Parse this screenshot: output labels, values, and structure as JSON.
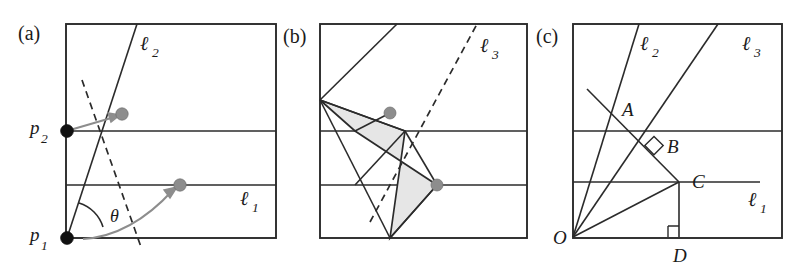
{
  "figure": {
    "width": 807,
    "height": 272,
    "background": "#ffffff",
    "ink_color": "#2b2b2b",
    "accent_grey": "#8d8d8d",
    "shade_fill": "#e6e6e6"
  },
  "panels": [
    {
      "tag": "(a)",
      "tag_pos": {
        "x": 18,
        "y": 40
      },
      "frame": {
        "x": 66,
        "y": 24,
        "w": 210,
        "h": 214
      },
      "horizontal_lines_y": [
        131,
        185
      ],
      "labels": [
        {
          "name": "line-label-l2",
          "base": "ℓ",
          "sub": "2",
          "x": 140,
          "y": 50
        },
        {
          "name": "line-label-l1",
          "base": "ℓ",
          "sub": "1",
          "x": 240,
          "y": 205
        },
        {
          "name": "point-label-p2",
          "base": "p",
          "sub": "2",
          "x": 30,
          "y": 134
        },
        {
          "name": "point-label-p1",
          "base": "p",
          "sub": "1",
          "x": 30,
          "y": 241
        },
        {
          "name": "angle-label-theta",
          "base": "θ",
          "sub": "",
          "x": 110,
          "y": 222
        }
      ],
      "points": [
        {
          "name": "point-p1",
          "x": 67,
          "y": 238,
          "kind": "black"
        },
        {
          "name": "point-p2",
          "x": 67,
          "y": 131,
          "kind": "black"
        },
        {
          "name": "point-moving-upper",
          "x": 122,
          "y": 114,
          "kind": "grey"
        },
        {
          "name": "point-moving-lower",
          "x": 180,
          "y": 185,
          "kind": "grey"
        }
      ],
      "solid_ray": {
        "x1": 67,
        "y1": 238,
        "x2": 137,
        "y2": 24
      },
      "dashed_ray": {
        "x1": 82,
        "y1": 80,
        "x2": 141,
        "y2": 247
      },
      "arrows": [
        {
          "name": "arrow-to-upper-point",
          "from_x": 67,
          "from_y": 131,
          "to_x": 121,
          "to_y": 115
        },
        {
          "name": "arrow-to-lower-point",
          "from_x": 100,
          "from_y": 238,
          "to_x": 179,
          "to_y": 186
        }
      ]
    },
    {
      "tag": "(b)",
      "tag_pos": {
        "x": 283,
        "y": 43
      },
      "frame": {
        "x": 320,
        "y": 24,
        "w": 207,
        "h": 214
      },
      "horizontal_lines_y": [
        131,
        185
      ],
      "labels": [
        {
          "name": "line-label-l3",
          "base": "ℓ",
          "sub": "3",
          "x": 480,
          "y": 52
        }
      ],
      "points": [
        {
          "name": "point-contact-upper",
          "x": 390,
          "y": 113,
          "kind": "grey"
        },
        {
          "name": "point-contact-lower",
          "x": 437,
          "y": 185,
          "kind": "grey"
        }
      ],
      "apex": {
        "x": 320,
        "y": 100
      },
      "dashed_ray": {
        "x1": 370,
        "y1": 222,
        "x2": 477,
        "y2": 24
      },
      "wedge_edges": [
        {
          "x1": 320,
          "y1": 100,
          "x2": 405,
          "y2": 131
        },
        {
          "x1": 320,
          "y1": 100,
          "x2": 397,
          "y2": 24
        },
        {
          "x1": 320,
          "y1": 100,
          "x2": 390,
          "y2": 238
        }
      ],
      "shaded_polygon": [
        [
          320,
          100
        ],
        [
          405,
          131
        ],
        [
          390,
          238
        ],
        [
          437,
          185
        ],
        [
          355,
          131
        ]
      ]
    },
    {
      "tag": "(c)",
      "tag_pos": {
        "x": 536,
        "y": 43
      },
      "frame": {
        "x": 573,
        "y": 24,
        "w": 209,
        "h": 214
      },
      "horizontal_lines_y": [
        131,
        182
      ],
      "labels": [
        {
          "name": "line-label-l2",
          "base": "ℓ",
          "sub": "2",
          "x": 640,
          "y": 50
        },
        {
          "name": "line-label-l3",
          "base": "ℓ",
          "sub": "3",
          "x": 742,
          "y": 50
        },
        {
          "name": "line-label-l1",
          "base": "ℓ",
          "sub": "1",
          "x": 748,
          "y": 206
        },
        {
          "name": "point-label-A",
          "base": "A",
          "sub": "",
          "x": 622,
          "y": 116
        },
        {
          "name": "point-label-B",
          "base": "B",
          "sub": "",
          "x": 667,
          "y": 153
        },
        {
          "name": "point-label-C",
          "base": "C",
          "sub": "",
          "x": 692,
          "y": 188
        },
        {
          "name": "point-label-O",
          "base": "O",
          "sub": "",
          "x": 553,
          "y": 244
        },
        {
          "name": "point-label-D",
          "base": "D",
          "sub": "",
          "x": 673,
          "y": 262
        }
      ],
      "origin": {
        "x": 573,
        "y": 237
      },
      "vertex_A": {
        "x": 616,
        "y": 110
      },
      "vertex_B": {
        "x": 654,
        "y": 147
      },
      "vertex_C": {
        "x": 679,
        "y": 182
      },
      "vertex_D": {
        "x": 679,
        "y": 237
      },
      "rays_from_O": [
        {
          "name": "ray-l2",
          "x2": 639,
          "y2": 24
        },
        {
          "name": "ray-l3",
          "x2": 718,
          "y2": 24
        },
        {
          "name": "ray-to-C",
          "x2": 679,
          "y2": 182
        }
      ],
      "descending_line": {
        "x1": 587,
        "y1": 89,
        "x2": 679,
        "y2": 182
      },
      "segment_CD": {
        "x1": 679,
        "y1": 182,
        "x2": 679,
        "y2": 237
      },
      "segment_C_right": {
        "x1": 679,
        "y1": 182,
        "x2": 760,
        "y2": 182
      },
      "right_angle_marks": [
        {
          "name": "right-angle-at-B",
          "x": 654,
          "y": 147,
          "size": 9,
          "rotated": true
        },
        {
          "name": "right-angle-at-D",
          "x": 679,
          "y": 237,
          "size": 11,
          "rotated": false
        }
      ]
    }
  ]
}
